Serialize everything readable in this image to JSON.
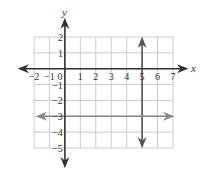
{
  "chart_data": {
    "type": "line",
    "title": "",
    "xlabel": "x",
    "ylabel": "y",
    "xlim": [
      -2,
      7
    ],
    "ylim": [
      -5,
      2
    ],
    "grid": true,
    "x_ticks": [
      -2,
      -1,
      0,
      1,
      2,
      3,
      4,
      5,
      6,
      7
    ],
    "y_ticks": [
      2,
      1,
      -1,
      -2,
      -3,
      -4,
      -5
    ],
    "x_tick_labels": [
      "−2",
      "−1",
      "0",
      "1",
      "2",
      "3",
      "4",
      "5",
      "6",
      "7"
    ],
    "y_tick_labels": [
      "2",
      "1",
      "−1",
      "−2",
      "−3",
      "−4",
      "−5"
    ],
    "series": [
      {
        "name": "x = 5",
        "kind": "vertical",
        "x": [
          5,
          5
        ],
        "y": [
          2,
          -5
        ],
        "color": "#555555",
        "arrows": "both"
      },
      {
        "name": "y = -3",
        "kind": "horizontal",
        "x": [
          -2,
          7
        ],
        "y": [
          -3,
          -3
        ],
        "color": "#888888",
        "arrows": "both"
      }
    ],
    "colors": {
      "axis": "#333333",
      "grid": "#cccccc",
      "vertical_line": "#555555",
      "horizontal_line": "#888888"
    }
  }
}
